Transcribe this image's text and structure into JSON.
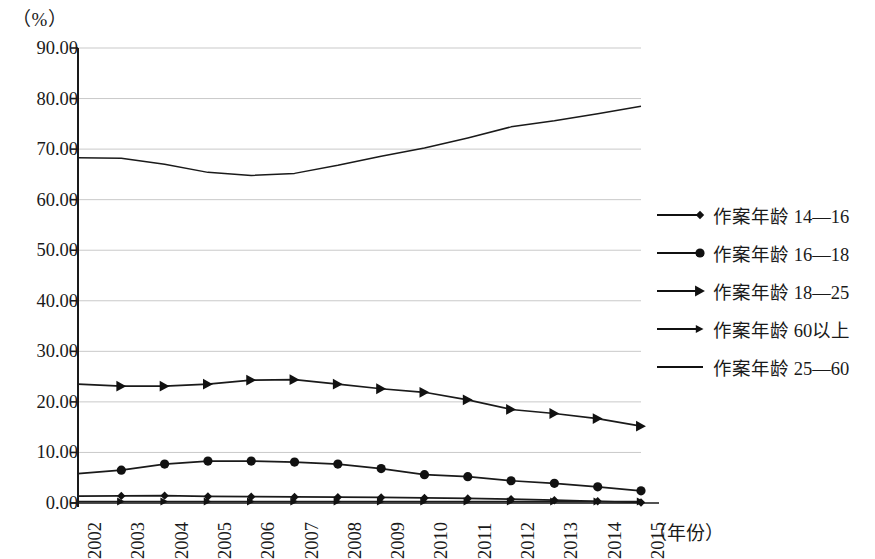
{
  "chart_data": {
    "type": "line",
    "title": "",
    "subtitle": "",
    "ylabel": "（%）",
    "xlabel": "（年份）",
    "x": [
      2002,
      2003,
      2004,
      2005,
      2006,
      2007,
      2008,
      2009,
      2010,
      2011,
      2012,
      2013,
      2014,
      2015
    ],
    "categories": [
      "2002",
      "2003",
      "2004",
      "2005",
      "2006",
      "2007",
      "2008",
      "2009",
      "2010",
      "2011",
      "2012",
      "2013",
      "2014",
      "2015"
    ],
    "ylim": [
      0,
      90
    ],
    "ytick_labels": [
      "90.00",
      "80.00",
      "70.00",
      "60.00",
      "50.00",
      "40.00",
      "30.00",
      "20.00",
      "10.00",
      "0.00"
    ],
    "ytick_values": [
      90,
      80,
      70,
      60,
      50,
      40,
      30,
      20,
      10,
      0
    ],
    "grid": true,
    "grid_axis": "y",
    "legend_position": "right",
    "line_color": "#1a1a1a",
    "grid_color": "#c9c9c9",
    "axis_color": "#1a1a1a",
    "series": [
      {
        "name": "作案年龄 14—16",
        "marker": "diamond",
        "values": [
          1.35,
          1.4,
          1.45,
          1.3,
          1.25,
          1.2,
          1.15,
          1.1,
          1.0,
          0.9,
          0.75,
          0.55,
          0.35,
          0.1
        ]
      },
      {
        "name": "作案年龄 16—18",
        "marker": "circle",
        "values": [
          5.8,
          6.5,
          7.7,
          8.3,
          8.3,
          8.1,
          7.7,
          6.8,
          5.6,
          5.2,
          4.4,
          3.9,
          3.2,
          2.4
        ]
      },
      {
        "name": "作案年龄 18—25",
        "marker": "triangle",
        "values": [
          23.5,
          23.1,
          23.1,
          23.5,
          24.3,
          24.4,
          23.5,
          22.6,
          21.9,
          20.4,
          18.5,
          17.7,
          16.7,
          15.2
        ]
      },
      {
        "name": "作案年龄 60以上",
        "marker": "arrow",
        "values": [
          0.3,
          0.3,
          0.3,
          0.3,
          0.3,
          0.3,
          0.3,
          0.3,
          0.3,
          0.3,
          0.3,
          0.3,
          0.3,
          0.3
        ]
      },
      {
        "name": "作案年龄 25—60",
        "marker": "none",
        "values": [
          68.3,
          68.2,
          67.0,
          65.4,
          64.8,
          65.2,
          66.8,
          68.6,
          70.2,
          72.2,
          74.4,
          75.6,
          77.0,
          78.5
        ]
      }
    ]
  },
  "legend": {
    "items": [
      {
        "label": "作案年龄 14—16",
        "marker": "diamond"
      },
      {
        "label": "作案年龄 16—18",
        "marker": "circle"
      },
      {
        "label": "作案年龄 18—25",
        "marker": "triangle"
      },
      {
        "label": "作案年龄 60以上",
        "marker": "arrow"
      },
      {
        "label": "作案年龄 25—60",
        "marker": "none"
      }
    ]
  },
  "axes": {
    "y_unit": "（%）",
    "x_title": "（年份）"
  }
}
